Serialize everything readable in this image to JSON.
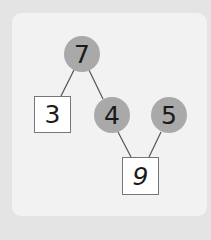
{
  "diagram": {
    "type": "number-bond-tree",
    "colors": {
      "background": "#e4e4e4",
      "panel": "#f2f2f2",
      "circle_fill": "#a9a9a9",
      "box_fill": "#ffffff",
      "line": "#555555"
    },
    "nodes": [
      {
        "id": "n7",
        "value": "7",
        "shape": "circle",
        "cx": 82,
        "cy": 54,
        "r": 18
      },
      {
        "id": "n3",
        "value": "3",
        "shape": "box",
        "x": 34,
        "y": 96,
        "w": 37,
        "h": 37
      },
      {
        "id": "n4",
        "value": "4",
        "shape": "circle",
        "cx": 112,
        "cy": 115,
        "r": 18
      },
      {
        "id": "n5",
        "value": "5",
        "shape": "circle",
        "cx": 169,
        "cy": 115,
        "r": 18
      },
      {
        "id": "n9",
        "value": "9",
        "shape": "box",
        "x": 122,
        "y": 157,
        "w": 37,
        "h": 38
      }
    ],
    "edges": [
      {
        "from": "n7",
        "to": "n3"
      },
      {
        "from": "n7",
        "to": "n4"
      },
      {
        "from": "n4",
        "to": "n9"
      },
      {
        "from": "n5",
        "to": "n9"
      }
    ]
  }
}
